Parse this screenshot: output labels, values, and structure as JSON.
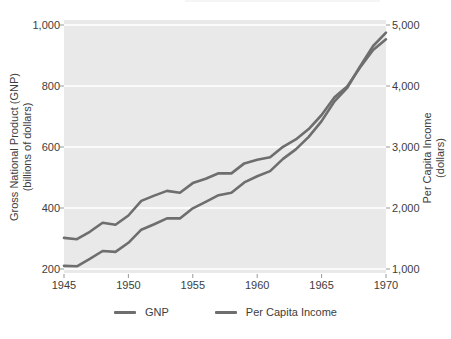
{
  "chart_data": {
    "type": "line",
    "x": [
      1945,
      1946,
      1947,
      1948,
      1949,
      1950,
      1951,
      1952,
      1953,
      1954,
      1955,
      1956,
      1957,
      1958,
      1959,
      1960,
      1961,
      1962,
      1963,
      1964,
      1965,
      1966,
      1967,
      1968,
      1969,
      1970
    ],
    "series": [
      {
        "name": "GNP",
        "axis": "left",
        "color": "#6e6e6e",
        "values": [
          210,
          209,
          233,
          259,
          256,
          286,
          329,
          347,
          366,
          366,
          399,
          420,
          442,
          450,
          484,
          504,
          521,
          561,
          592,
          633,
          685,
          750,
          795,
          865,
          931,
          975
        ]
      },
      {
        "name": "Per Capita Income",
        "axis": "right",
        "color": "#6e6e6e",
        "values": [
          1510,
          1488,
          1610,
          1758,
          1726,
          1877,
          2117,
          2204,
          2281,
          2250,
          2408,
          2480,
          2570,
          2568,
          2731,
          2792,
          2831,
          3004,
          3125,
          3293,
          3524,
          3815,
          3995,
          4306,
          4591,
          4765
        ]
      }
    ],
    "left_axis": {
      "title_line1": "Gross National Product (GNP)",
      "title_line2": "(billions of dollars)",
      "tick_labels": [
        "200",
        "400",
        "600",
        "800",
        "1,000"
      ],
      "tick_values": [
        200,
        400,
        600,
        800,
        1000
      ],
      "min": 200,
      "max": 1000
    },
    "right_axis": {
      "title_line1": "Per Capita Income",
      "title_line2": "(dollars)",
      "tick_labels": [
        "1,000",
        "2,000",
        "3,000",
        "4,000",
        "5,000"
      ],
      "tick_values": [
        1000,
        2000,
        3000,
        4000,
        5000
      ],
      "min": 1000,
      "max": 5000
    },
    "x_axis": {
      "tick_labels": [
        "1945",
        "1950",
        "1955",
        "1960",
        "1965",
        "1970"
      ],
      "tick_values": [
        1945,
        1950,
        1955,
        1960,
        1965,
        1970
      ],
      "min": 1945,
      "max": 1970
    },
    "grid": true,
    "legend_position": "bottom",
    "plot_bg": "#e9e9e9",
    "gridline_color": "#ffffff",
    "tick_mark_color": "#999999"
  },
  "legend": {
    "items": [
      {
        "label": "GNP"
      },
      {
        "label": "Per Capita Income"
      }
    ]
  }
}
